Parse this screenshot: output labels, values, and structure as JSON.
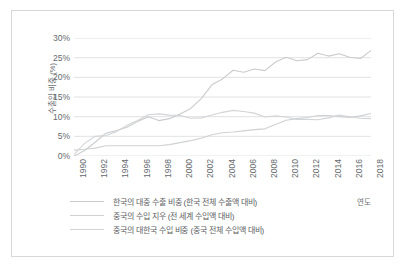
{
  "chart_data": {
    "type": "line",
    "title": "",
    "xlabel": "연도",
    "ylabel": "수출입 비중 (%)",
    "grid": true,
    "legend_position": "bottom-left",
    "xlim": [
      1990,
      2018
    ],
    "ylim": [
      0,
      30
    ],
    "ytick_labels": [
      "30%",
      "25%",
      "20%",
      "15%",
      "10%",
      "5%",
      "0%"
    ],
    "ytick_values": [
      30,
      25,
      20,
      15,
      10,
      5,
      0
    ],
    "xtick_labels": [
      "1990",
      "1992",
      "1994",
      "1996",
      "1998",
      "2000",
      "2002",
      "2004",
      "2006",
      "2008",
      "2010",
      "2012",
      "2014",
      "2016",
      "2018"
    ],
    "x": [
      1990,
      1991,
      1992,
      1993,
      1994,
      1995,
      1996,
      1997,
      1998,
      1999,
      2000,
      2001,
      2002,
      2003,
      2004,
      2005,
      2006,
      2007,
      2008,
      2009,
      2010,
      2011,
      2012,
      2013,
      2014,
      2015,
      2016,
      2017,
      2018
    ],
    "series": [
      {
        "name": "한국의 대중 수출 비중 (한국 전체 수출액 대비)",
        "color": "#c9cbcd",
        "values": [
          0.0,
          1.4,
          3.5,
          5.8,
          6.5,
          7.3,
          8.8,
          10.0,
          9.0,
          9.5,
          10.7,
          12.1,
          14.6,
          18.1,
          19.6,
          21.8,
          21.3,
          22.1,
          21.7,
          23.9,
          25.1,
          24.2,
          24.5,
          26.1,
          25.4,
          26.0,
          25.1,
          24.8,
          26.8
        ]
      },
      {
        "name": "중국의 수입 지우 (전 세계 수입액 대비)",
        "color": "#cfd1d3",
        "values": [
          1.5,
          1.7,
          2.0,
          2.6,
          2.6,
          2.6,
          2.6,
          2.6,
          2.6,
          2.9,
          3.4,
          3.9,
          4.5,
          5.4,
          5.9,
          6.1,
          6.4,
          6.7,
          6.9,
          8.0,
          9.1,
          9.5,
          9.8,
          10.3,
          10.3,
          10.0,
          9.8,
          10.2,
          10.8
        ]
      },
      {
        "name": "중국의 대한국 수입 비중 (중국 전체 수입액 대비)",
        "color": "#d2d4d6",
        "values": [
          0.4,
          3.2,
          5.0,
          5.2,
          6.2,
          7.8,
          9.0,
          10.5,
          10.7,
          10.4,
          10.3,
          9.6,
          9.7,
          10.4,
          11.1,
          11.6,
          11.3,
          10.9,
          9.9,
          10.2,
          9.9,
          9.3,
          9.3,
          9.2,
          9.7,
          10.4,
          10.0,
          9.6,
          9.5
        ]
      }
    ]
  },
  "legend": {
    "items": [
      {
        "label": "한국의 대중 수출 비중 (한국 전체 수출액 대비)",
        "color": "#c9cbcd"
      },
      {
        "label": "중국의 수입 지우 (전 세계 수입액 대비)",
        "color": "#cfd1d3"
      },
      {
        "label": "중국의 대한국 수입 비중 (중국 전체 수입액 대비)",
        "color": "#d2d4d6"
      }
    ]
  },
  "axes": {
    "y_title": "수출입 비중 (%)",
    "x_title": "연도"
  }
}
